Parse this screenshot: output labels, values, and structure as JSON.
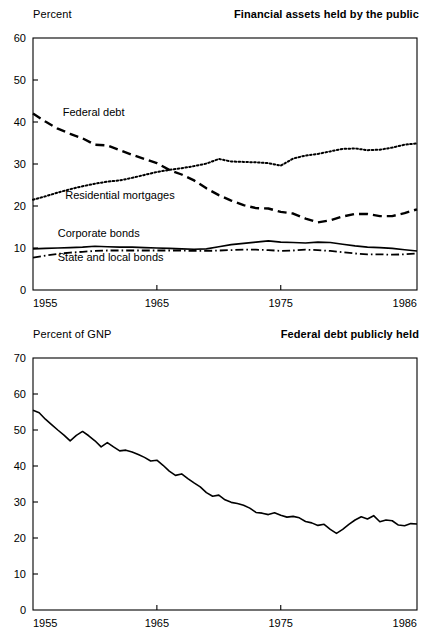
{
  "page": {
    "background_color": "#ffffff",
    "ink_color": "#000000"
  },
  "charts": [
    {
      "id": "financial-assets",
      "unit_label": "Percent",
      "title": "Financial assets held by the public"
    },
    {
      "id": "federal-debt-gnp",
      "unit_label": "Percent of GNP",
      "title": "Federal debt publicly held"
    }
  ],
  "chart_data": [
    {
      "type": "line",
      "title": "Financial assets held by the public",
      "xlabel": "",
      "ylabel": "Percent",
      "xlim": [
        1955,
        1986
      ],
      "ylim": [
        0,
        60
      ],
      "yticks": [
        0,
        10,
        20,
        30,
        40,
        50,
        60
      ],
      "xticks": [
        1955,
        1965,
        1975,
        1986
      ],
      "xtick_labels": [
        "1955",
        "1965",
        "1975",
        "1986"
      ],
      "ytick_labels": [
        "0",
        "10",
        "20",
        "30",
        "40",
        "50",
        "60"
      ],
      "grid": false,
      "legend": "inline-annotations",
      "x": [
        1955,
        1956,
        1957,
        1958,
        1959,
        1960,
        1961,
        1962,
        1963,
        1964,
        1965,
        1966,
        1967,
        1968,
        1969,
        1970,
        1971,
        1972,
        1973,
        1974,
        1975,
        1976,
        1977,
        1978,
        1979,
        1980,
        1981,
        1982,
        1983,
        1984,
        1985,
        1986
      ],
      "series": [
        {
          "name": "Federal debt",
          "style": "dashed",
          "label_x": 1957.4,
          "label_y": 41.5,
          "values": [
            42.0,
            40.1,
            38.4,
            37.2,
            36.1,
            34.6,
            34.4,
            33.3,
            32.2,
            31.2,
            30.2,
            28.6,
            27.5,
            26.1,
            24.2,
            22.6,
            21.3,
            20.2,
            19.5,
            19.4,
            18.6,
            18.2,
            17.0,
            16.1,
            16.6,
            17.5,
            18.1,
            18.1,
            17.6,
            17.6,
            18.3,
            19.2
          ]
        },
        {
          "name": "Residential mortgages",
          "style": "dotted",
          "label_x": 1957.6,
          "label_y": 21.6,
          "values": [
            21.5,
            22.3,
            23.2,
            24.0,
            24.7,
            25.3,
            25.8,
            26.1,
            26.7,
            27.4,
            28.1,
            28.6,
            29.0,
            29.5,
            30.1,
            31.2,
            30.6,
            30.5,
            30.4,
            30.2,
            29.6,
            31.3,
            32.0,
            32.4,
            33.0,
            33.6,
            33.7,
            33.3,
            33.4,
            33.9,
            34.6,
            34.9
          ]
        },
        {
          "name": "Corporate bonds",
          "style": "solid",
          "label_x": 1957.0,
          "label_y": 12.6,
          "values": [
            9.8,
            9.9,
            10.0,
            10.1,
            10.2,
            10.4,
            10.3,
            10.2,
            10.2,
            10.1,
            10.0,
            9.9,
            9.8,
            9.7,
            9.8,
            10.3,
            10.8,
            11.1,
            11.4,
            11.7,
            11.4,
            11.3,
            11.2,
            11.4,
            11.3,
            10.9,
            10.5,
            10.2,
            10.1,
            9.9,
            9.6,
            9.3
          ]
        },
        {
          "name": "State and local bonds",
          "style": "dash-dot",
          "label_x": 1957.0,
          "label_y": 6.9,
          "values": [
            7.7,
            8.2,
            8.6,
            8.9,
            9.1,
            9.3,
            9.4,
            9.4,
            9.4,
            9.4,
            9.4,
            9.4,
            9.4,
            9.3,
            9.3,
            9.4,
            9.5,
            9.6,
            9.6,
            9.5,
            9.3,
            9.4,
            9.6,
            9.5,
            9.3,
            9.0,
            8.7,
            8.5,
            8.5,
            8.4,
            8.5,
            8.7
          ]
        }
      ]
    },
    {
      "type": "line",
      "title": "Federal debt publicly held",
      "xlabel": "",
      "ylabel": "Percent of GNP",
      "xlim": [
        1955,
        1986
      ],
      "ylim": [
        0,
        70
      ],
      "yticks": [
        0,
        10,
        20,
        30,
        40,
        50,
        60,
        70
      ],
      "xticks": [
        1955,
        1965,
        1975,
        1986
      ],
      "xtick_labels": [
        "1955",
        "1965",
        "1975",
        "1986"
      ],
      "ytick_labels": [
        "0",
        "10",
        "20",
        "30",
        "40",
        "50",
        "60",
        "70"
      ],
      "grid": false,
      "legend": "none",
      "x": [
        1955.0,
        1955.5,
        1956.0,
        1956.5,
        1957.0,
        1957.5,
        1958.0,
        1958.5,
        1959.0,
        1959.5,
        1960.0,
        1960.5,
        1961.0,
        1961.5,
        1962.0,
        1962.5,
        1963.0,
        1963.5,
        1964.0,
        1964.5,
        1965.0,
        1965.5,
        1966.0,
        1966.5,
        1967.0,
        1967.5,
        1968.0,
        1968.5,
        1969.0,
        1969.5,
        1970.0,
        1970.5,
        1971.0,
        1971.5,
        1972.0,
        1972.5,
        1973.0,
        1973.5,
        1974.0,
        1974.5,
        1975.0,
        1975.5,
        1976.0,
        1976.5,
        1977.0,
        1977.5,
        1978.0,
        1978.5,
        1979.0,
        1979.5,
        1980.0,
        1980.5,
        1981.0,
        1981.5,
        1982.0,
        1982.5,
        1983.0,
        1983.5,
        1984.0,
        1984.5,
        1985.0,
        1985.5,
        1986.0
      ],
      "series": [
        {
          "name": "Federal debt publicly held",
          "style": "solid",
          "values": [
            55.5,
            54.8,
            53.0,
            51.5,
            50.0,
            48.6,
            47.0,
            48.5,
            49.6,
            48.4,
            47.0,
            45.3,
            46.5,
            45.3,
            44.2,
            44.4,
            43.9,
            43.2,
            42.4,
            41.4,
            41.6,
            40.2,
            38.6,
            37.4,
            37.8,
            36.5,
            35.3,
            34.2,
            32.6,
            31.6,
            31.9,
            30.6,
            29.9,
            29.6,
            29.1,
            28.3,
            27.1,
            26.9,
            26.5,
            27.0,
            26.3,
            25.8,
            26.0,
            25.6,
            24.6,
            24.2,
            23.5,
            23.8,
            22.4,
            21.3,
            22.4,
            23.8,
            25.0,
            25.9,
            25.3,
            26.2,
            24.5,
            25.0,
            24.8,
            23.6,
            23.4,
            24.0,
            23.9
          ]
        }
      ]
    }
  ]
}
